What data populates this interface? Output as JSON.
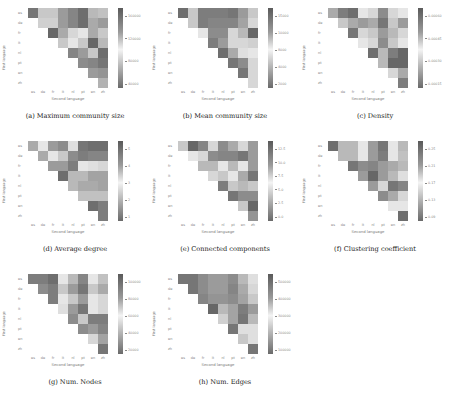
{
  "figure": {
    "panels": [
      {
        "id": "a",
        "caption": "(a) Maximum community size",
        "ylabel": "First language",
        "xlabel": "Second language",
        "cbar_ticks": [
          "160000",
          "120000",
          "80000",
          "40000"
        ]
      },
      {
        "id": "b",
        "caption": "(b) Mean community size",
        "ylabel": "First language",
        "xlabel": "Second language",
        "cbar_ticks": [
          "15000",
          "10000",
          "8000",
          "4000",
          "2000"
        ]
      },
      {
        "id": "c",
        "caption": "(c) Density",
        "ylabel": "First language",
        "xlabel": "Second language",
        "cbar_ticks": [
          "0.00060",
          "0.00045",
          "0.00030",
          "0.00015"
        ]
      },
      {
        "id": "d",
        "caption": "(d) Average degree",
        "ylabel": "First language",
        "xlabel": "Second language",
        "cbar_ticks": [
          "5",
          "4",
          "3",
          "2",
          "1"
        ]
      },
      {
        "id": "e",
        "caption": "(e) Connected components",
        "ylabel": "First language",
        "xlabel": "Second language",
        "cbar_ticks": [
          "12.5",
          "10.0",
          "7.5",
          "5.0",
          "2.5",
          "0.0"
        ]
      },
      {
        "id": "f",
        "caption": "(f) Clustering coefficient",
        "ylabel": "First language",
        "xlabel": "Second language",
        "cbar_ticks": [
          "0.25",
          "0.21",
          "0.17",
          "0.13",
          "0.09"
        ]
      },
      {
        "id": "g",
        "caption": "(g) Num. Nodes",
        "ylabel": "First language",
        "xlabel": "Second language",
        "cbar_ticks": [
          "100000",
          "80000",
          "60000",
          "40000",
          "20000"
        ]
      },
      {
        "id": "h",
        "caption": "(h) Num. Edges",
        "ylabel": "First language",
        "xlabel": "Second language",
        "cbar_ticks": [
          "500000",
          "400000",
          "300000",
          "200000",
          "100000"
        ]
      }
    ],
    "x_ticks": [
      "es",
      "de",
      "fr",
      "it",
      "nl",
      "pt",
      "en",
      "zh"
    ],
    "y_ticks": [
      "es",
      "de",
      "fr",
      "it",
      "nl",
      "pt",
      "en",
      "zh"
    ]
  },
  "chart_data": [
    {
      "type": "heatmap",
      "title": "(a) Maximum community size",
      "xlabel": "Second language",
      "ylabel": "First language",
      "colorbar_ticks": [
        160000,
        120000,
        80000,
        40000
      ],
      "grid_intensity": [
        [
          0.85,
          0.3,
          0.3,
          0.6,
          0.75,
          0.9,
          0.4,
          0.35
        ],
        [
          null,
          0.25,
          0.25,
          0.6,
          0.75,
          0.9,
          0.5,
          0.6
        ],
        [
          null,
          null,
          0.95,
          0.5,
          0.2,
          0.1,
          0.5,
          0.3
        ],
        [
          null,
          null,
          null,
          0.3,
          0.1,
          0.3,
          0.95,
          0.4
        ],
        [
          null,
          null,
          null,
          null,
          0.75,
          0.6,
          0.3,
          0.9
        ],
        [
          null,
          null,
          null,
          null,
          null,
          0.7,
          0.75,
          0.85
        ],
        [
          null,
          null,
          null,
          null,
          null,
          null,
          0.6,
          0.65
        ],
        [
          null,
          null,
          null,
          null,
          null,
          null,
          null,
          0.45
        ]
      ]
    },
    {
      "type": "heatmap",
      "title": "(b) Mean community size",
      "xlabel": "Second language",
      "ylabel": "First language",
      "colorbar_ticks": [
        15000,
        10000,
        8000,
        4000,
        2000
      ],
      "grid_intensity": [
        [
          0.9,
          0.3,
          0.8,
          0.8,
          0.8,
          0.85,
          0.6,
          0.3
        ],
        [
          null,
          0.3,
          0.8,
          0.75,
          0.75,
          0.75,
          0.55,
          0.2
        ],
        [
          null,
          null,
          0.1,
          0.7,
          0.7,
          0.2,
          0.4,
          0.95
        ],
        [
          null,
          null,
          null,
          0.8,
          0.6,
          0.2,
          0.2,
          0.25
        ],
        [
          null,
          null,
          null,
          null,
          0.9,
          0.5,
          0.15,
          0.1
        ],
        [
          null,
          null,
          null,
          null,
          null,
          0.85,
          0.7,
          0.2
        ],
        [
          null,
          null,
          null,
          null,
          null,
          null,
          0.85,
          0.2
        ],
        [
          null,
          null,
          null,
          null,
          null,
          null,
          null,
          0.2
        ]
      ]
    },
    {
      "type": "heatmap",
      "title": "(c) Density",
      "xlabel": "Second language",
      "ylabel": "First language",
      "colorbar_ticks": [
        0.0006,
        0.00045,
        0.0003,
        0.00015
      ],
      "grid_intensity": [
        [
          0.5,
          0.8,
          0.9,
          0.1,
          0.2,
          0.7,
          0.2,
          0.1
        ],
        [
          null,
          0.3,
          0.5,
          0.6,
          0.5,
          0.85,
          0.3,
          0.6
        ],
        [
          null,
          null,
          0.85,
          0.2,
          0.3,
          0.6,
          0.4,
          0.2
        ],
        [
          null,
          null,
          null,
          0.1,
          0.2,
          0.7,
          0.3,
          0.1
        ],
        [
          null,
          null,
          null,
          null,
          0.9,
          0.4,
          0.8,
          0.95
        ],
        [
          null,
          null,
          null,
          null,
          null,
          0.4,
          0.95,
          0.95
        ],
        [
          null,
          null,
          null,
          null,
          null,
          null,
          0.2,
          0.5
        ],
        [
          null,
          null,
          null,
          null,
          null,
          null,
          null,
          0.8
        ]
      ]
    },
    {
      "type": "heatmap",
      "title": "(d) Average degree",
      "xlabel": "Second language",
      "ylabel": "First language",
      "colorbar_ticks": [
        5,
        4,
        3,
        2,
        1
      ],
      "grid_intensity": [
        [
          0.5,
          0.1,
          0.6,
          0.7,
          0.15,
          0.85,
          0.9,
          0.9
        ],
        [
          null,
          0.5,
          0.1,
          0.3,
          0.7,
          0.8,
          0.75,
          0.75
        ],
        [
          null,
          null,
          0.6,
          0.6,
          0.8,
          0.1,
          0.15,
          0.2
        ],
        [
          null,
          null,
          null,
          0.9,
          0.4,
          0.4,
          0.55,
          0.55
        ],
        [
          null,
          null,
          null,
          null,
          0.4,
          0.5,
          0.5,
          0.55
        ],
        [
          null,
          null,
          null,
          null,
          null,
          0.35,
          0.35,
          0.35
        ],
        [
          null,
          null,
          null,
          null,
          null,
          null,
          0.9,
          0.8
        ],
        [
          null,
          null,
          null,
          null,
          null,
          null,
          null,
          0.8
        ]
      ]
    },
    {
      "type": "heatmap",
      "title": "(e) Connected components",
      "xlabel": "Second language",
      "ylabel": "First language",
      "colorbar_ticks": [
        12.5,
        10.0,
        7.5,
        5.0,
        2.5,
        0.0
      ],
      "grid_intensity": [
        [
          0.3,
          0.95,
          0.75,
          0.2,
          0.7,
          0.5,
          0.2,
          0.6
        ],
        [
          null,
          0.1,
          0.2,
          0.7,
          0.75,
          0.75,
          0.85,
          0.6
        ],
        [
          null,
          null,
          0.4,
          0.4,
          0.1,
          0.4,
          0.1,
          0.6
        ],
        [
          null,
          null,
          null,
          0.2,
          0.3,
          0.1,
          0.5,
          0.85
        ],
        [
          null,
          null,
          null,
          null,
          0.8,
          0.3,
          0.4,
          0.3
        ],
        [
          null,
          null,
          null,
          null,
          null,
          0.85,
          0.7,
          0.7
        ],
        [
          null,
          null,
          null,
          null,
          null,
          null,
          0.3,
          0.95
        ],
        [
          null,
          null,
          null,
          null,
          null,
          null,
          null,
          0.65
        ]
      ]
    },
    {
      "type": "heatmap",
      "title": "(f) Clustering coefficient",
      "xlabel": "Second language",
      "ylabel": "First language",
      "colorbar_ticks": [
        0.25,
        0.21,
        0.17,
        0.13,
        0.09
      ],
      "grid_intensity": [
        [
          0.9,
          0.4,
          0.4,
          0.1,
          0.6,
          0.85,
          0.1,
          0.4
        ],
        [
          null,
          0.4,
          0.4,
          0.1,
          0.6,
          0.8,
          0.1,
          0.35
        ],
        [
          null,
          null,
          0.85,
          0.7,
          0.75,
          0.6,
          0.5,
          0.4
        ],
        [
          null,
          null,
          null,
          0.6,
          0.95,
          0.6,
          0.4,
          0.15
        ],
        [
          null,
          null,
          null,
          null,
          0.6,
          0.2,
          0.85,
          0.75
        ],
        [
          null,
          null,
          null,
          null,
          null,
          0.7,
          0.5,
          0.2
        ],
        [
          null,
          null,
          null,
          null,
          null,
          null,
          0.1,
          0.1
        ],
        [
          null,
          null,
          null,
          null,
          null,
          null,
          null,
          0.9
        ]
      ]
    },
    {
      "type": "heatmap",
      "title": "(g) Num. Nodes",
      "xlabel": "Second language",
      "ylabel": "First language",
      "colorbar_ticks": [
        100000,
        80000,
        60000,
        40000,
        20000
      ],
      "grid_intensity": [
        [
          0.8,
          0.8,
          0.9,
          0.1,
          0.4,
          0.75,
          0.1,
          0.35
        ],
        [
          null,
          0.7,
          0.8,
          0.3,
          0.6,
          0.85,
          0.3,
          0.5
        ],
        [
          null,
          null,
          0.8,
          0.1,
          0.3,
          0.6,
          0.1,
          0.2
        ],
        [
          null,
          null,
          null,
          0.15,
          0.6,
          0.85,
          0.1,
          0.2
        ],
        [
          null,
          null,
          null,
          null,
          0.7,
          0.3,
          0.8,
          0.8
        ],
        [
          null,
          null,
          null,
          null,
          null,
          0.7,
          0.6,
          0.75
        ],
        [
          null,
          null,
          null,
          null,
          null,
          null,
          0.2,
          0.55
        ],
        [
          null,
          null,
          null,
          null,
          null,
          null,
          null,
          0.85
        ]
      ]
    },
    {
      "type": "heatmap",
      "title": "(h) Num. Edges",
      "xlabel": "Second language",
      "ylabel": "First language",
      "colorbar_ticks": [
        500000,
        400000,
        300000,
        200000,
        100000
      ],
      "grid_intensity": [
        [
          0.85,
          0.85,
          0.7,
          0.6,
          0.6,
          0.7,
          0.4,
          0.15
        ],
        [
          null,
          0.85,
          0.7,
          0.6,
          0.6,
          0.75,
          0.5,
          0.2
        ],
        [
          null,
          null,
          0.75,
          0.65,
          0.65,
          0.7,
          0.55,
          0.3
        ],
        [
          null,
          null,
          null,
          0.95,
          0.4,
          0.55,
          0.8,
          0.6
        ],
        [
          null,
          null,
          null,
          null,
          0.25,
          0.55,
          0.85,
          0.4
        ],
        [
          null,
          null,
          null,
          null,
          null,
          0.85,
          0.15,
          0.15
        ],
        [
          null,
          null,
          null,
          null,
          null,
          null,
          0.3,
          0.15
        ],
        [
          null,
          null,
          null,
          null,
          null,
          null,
          null,
          0.85
        ]
      ]
    }
  ]
}
